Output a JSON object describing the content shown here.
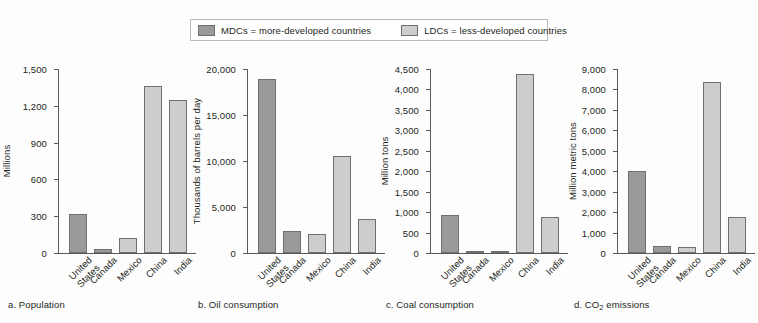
{
  "legend": {
    "entries": [
      {
        "key": "mdc",
        "label": "MDCs = more-developed countries",
        "color": "#9a9a9a"
      },
      {
        "key": "ldc",
        "label": "LDCs = less-developed countries",
        "color": "#cdcdcd"
      }
    ]
  },
  "colors": {
    "mdc": "#9a9a9a",
    "ldc": "#cdcdcd",
    "axis": "#58595b",
    "background": "#fdfdfd",
    "bar_border": "#6f6f6f"
  },
  "chart_data": [
    {
      "id": "a",
      "type": "bar",
      "caption": "a. Population",
      "caption_prefix": "a. ",
      "caption_text": "Population",
      "title": "",
      "xlabel": "",
      "ylabel": "Millions",
      "ylim": [
        0,
        1500
      ],
      "yticks": [
        0,
        300,
        600,
        900,
        1200,
        1500
      ],
      "ytick_labels": [
        "0",
        "300",
        "600",
        "900",
        "1,200",
        "1,500"
      ],
      "grid": false,
      "categories": [
        "United States",
        "Canada",
        "Mexico",
        "China",
        "India"
      ],
      "groups": [
        "mdc",
        "mdc",
        "ldc",
        "ldc",
        "ldc"
      ],
      "values": [
        320,
        34,
        120,
        1360,
        1250
      ]
    },
    {
      "id": "b",
      "type": "bar",
      "caption": "b. Oil consumption",
      "caption_prefix": "b. ",
      "caption_text": "Oil consumption",
      "title": "",
      "xlabel": "",
      "ylabel": "Thousands of barrels per day",
      "ylim": [
        0,
        20000
      ],
      "yticks": [
        0,
        5000,
        10000,
        15000,
        20000
      ],
      "ytick_labels": [
        "0",
        "5,000",
        "10,000",
        "15,000",
        "20,000"
      ],
      "grid": false,
      "categories": [
        "United States",
        "Canada",
        "Mexico",
        "China",
        "India"
      ],
      "groups": [
        "mdc",
        "mdc",
        "ldc",
        "ldc",
        "ldc"
      ],
      "values": [
        18900,
        2400,
        2100,
        10500,
        3700
      ]
    },
    {
      "id": "c",
      "type": "bar",
      "caption": "c. Coal consumption",
      "caption_prefix": "c. ",
      "caption_text": "Coal consumption",
      "title": "",
      "xlabel": "",
      "ylabel": "Million tons",
      "ylim": [
        0,
        4500
      ],
      "yticks": [
        0,
        500,
        1000,
        1500,
        2000,
        2500,
        3000,
        3500,
        4000,
        4500
      ],
      "ytick_labels": [
        "0",
        "500",
        "1,000",
        "1,500",
        "2,000",
        "2,500",
        "3,000",
        "3,500",
        "4,000",
        "4,500"
      ],
      "grid": false,
      "categories": [
        "United States",
        "Canada",
        "Mexico",
        "China",
        "India"
      ],
      "groups": [
        "mdc",
        "mdc",
        "ldc",
        "ldc",
        "ldc"
      ],
      "values": [
        930,
        40,
        30,
        4380,
        880
      ]
    },
    {
      "id": "d",
      "type": "bar",
      "caption": "d. CO2 emissions",
      "caption_prefix": "d. CO",
      "caption_sub": "2",
      "caption_suffix": " emissions",
      "title": "",
      "xlabel": "",
      "ylabel": "Million metric tons",
      "ylim": [
        0,
        9000
      ],
      "yticks": [
        0,
        1000,
        2000,
        3000,
        4000,
        5000,
        6000,
        7000,
        8000,
        9000
      ],
      "ytick_labels": [
        "0",
        "1,000",
        "2,000",
        "3,000",
        "4,000",
        "5,000",
        "6,000",
        "7,000",
        "8,000",
        "9,000"
      ],
      "grid": false,
      "categories": [
        "United States",
        "Canada",
        "Mexico",
        "China",
        "India"
      ],
      "groups": [
        "mdc",
        "mdc",
        "ldc",
        "ldc",
        "ldc"
      ],
      "values": [
        4000,
        330,
        290,
        8350,
        1780
      ]
    }
  ]
}
